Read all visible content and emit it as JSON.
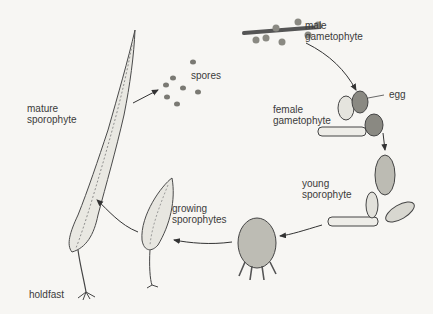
{
  "diagram": {
    "type": "life-cycle",
    "labels": {
      "male_gametophyte": [
        "male",
        "gametophyte"
      ],
      "egg": "egg",
      "female_gametophyte": [
        "female",
        "gametophyte"
      ],
      "young_sporophyte": [
        "young",
        "sporophyte"
      ],
      "growing_sporophytes": [
        "growing",
        "sporophytes"
      ],
      "mature_sporophyte": [
        "mature",
        "sporophyte"
      ],
      "holdfast": "holdfast",
      "spores": "spores"
    },
    "sequence": [
      "male gametophyte",
      "female gametophyte / egg",
      "young sporophyte",
      "embryo",
      "growing sporophytes",
      "mature sporophyte",
      "spores"
    ],
    "colors": {
      "background": "#f7f6f3",
      "ink": "#3b3b3b",
      "cell_fill": "#b9b9b0",
      "dark_cell": "#7d7d76"
    }
  }
}
